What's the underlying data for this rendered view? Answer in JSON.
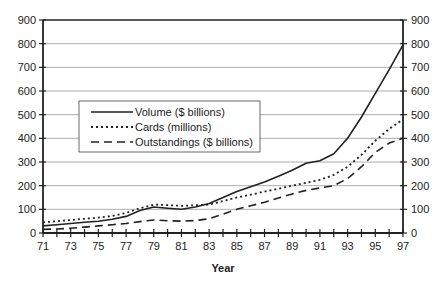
{
  "chart_data": {
    "type": "line",
    "title": "",
    "xlabel": "Year",
    "ylabel": "",
    "x": [
      71,
      72,
      73,
      74,
      75,
      76,
      77,
      78,
      79,
      80,
      81,
      82,
      83,
      84,
      85,
      86,
      87,
      88,
      89,
      90,
      91,
      92,
      93,
      94,
      95,
      96,
      97
    ],
    "x_tick_labels": [
      "71",
      "73",
      "75",
      "77",
      "79",
      "81",
      "83",
      "85",
      "87",
      "89",
      "91",
      "93",
      "95",
      "97"
    ],
    "y_ticks_left": [
      0,
      100,
      200,
      300,
      400,
      500,
      600,
      700,
      800,
      900
    ],
    "y_ticks_right": [
      0,
      100,
      200,
      300,
      400,
      500,
      600,
      700,
      800,
      900
    ],
    "ylim": [
      0,
      900
    ],
    "xlim": [
      71,
      97
    ],
    "grid": "horizontal",
    "legend_position": "inside-left-middle",
    "series": [
      {
        "name": "Volume ($ billions)",
        "style": "solid",
        "values": [
          30,
          35,
          40,
          45,
          50,
          58,
          70,
          95,
          110,
          105,
          100,
          110,
          125,
          150,
          175,
          195,
          215,
          240,
          265,
          295,
          305,
          335,
          400,
          490,
          590,
          690,
          795
        ]
      },
      {
        "name": "Cards (millions)",
        "style": "dotted",
        "values": [
          45,
          50,
          55,
          60,
          65,
          72,
          85,
          105,
          120,
          118,
          115,
          117,
          120,
          135,
          150,
          162,
          175,
          187,
          200,
          212,
          225,
          245,
          280,
          330,
          390,
          440,
          480
        ]
      },
      {
        "name": "Outstandings ($ billions)",
        "style": "dashed",
        "values": [
          15,
          17,
          20,
          25,
          30,
          35,
          40,
          48,
          55,
          52,
          50,
          53,
          60,
          80,
          100,
          115,
          130,
          148,
          165,
          180,
          190,
          200,
          230,
          280,
          340,
          380,
          400
        ]
      }
    ]
  }
}
